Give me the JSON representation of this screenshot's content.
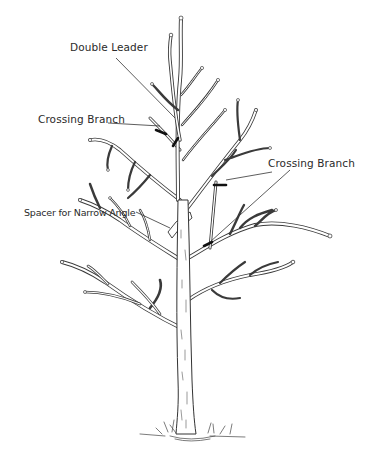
{
  "diagram": {
    "labels": [
      {
        "id": "double-leader",
        "text": "Double Leader"
      },
      {
        "id": "crossing-branch-left",
        "text": "Crossing Branch"
      },
      {
        "id": "crossing-branch-right",
        "text": "Crossing Branch"
      },
      {
        "id": "spacer-narrow-angle",
        "text": "Spacer for Narrow Angle"
      }
    ],
    "colors": {
      "background": "#ffffff",
      "ink": "#333333",
      "cut_marks": "#111111"
    }
  }
}
